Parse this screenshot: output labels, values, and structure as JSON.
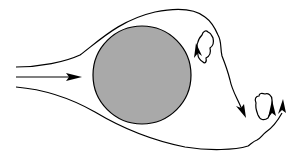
{
  "diagram": {
    "type": "flow-around-cylinder",
    "colors": {
      "background": "#ffffff",
      "stroke": "#000000",
      "body_fill": "#a9a9a9"
    },
    "elements": [
      {
        "id": "inlet-arrow",
        "kind": "arrow"
      },
      {
        "id": "cylinder",
        "kind": "circle"
      },
      {
        "id": "upper-streamline",
        "kind": "curve"
      },
      {
        "id": "lower-streamline",
        "kind": "curve"
      },
      {
        "id": "eddy-1",
        "kind": "vortex"
      },
      {
        "id": "eddy-2",
        "kind": "vortex"
      },
      {
        "id": "wake-arrow",
        "kind": "arrow"
      }
    ]
  }
}
